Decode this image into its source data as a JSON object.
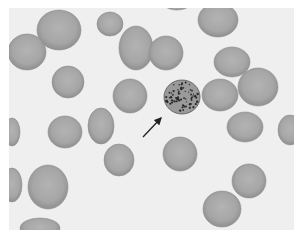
{
  "image": {
    "subject": "Blood smear micrograph showing red blood cells with one stippled cell indicated by an arrow",
    "colors": {
      "background": "#efefef",
      "rbc_fill": "#a9a9a9",
      "rbc_edge": "#8e8e8e",
      "stippled_cell": "#9a9a9a",
      "stipple_dots": "#2a2a2a",
      "arrow": "#222222"
    },
    "cells": [
      {
        "cx": 59,
        "cy": 30,
        "rx": 22,
        "ry": 20
      },
      {
        "cx": 27,
        "cy": 52,
        "rx": 19,
        "ry": 18
      },
      {
        "cx": 110,
        "cy": 24,
        "rx": 13,
        "ry": 12
      },
      {
        "cx": 136,
        "cy": 48,
        "rx": 17,
        "ry": 22
      },
      {
        "cx": 166,
        "cy": 53,
        "rx": 17,
        "ry": 17
      },
      {
        "cx": 218,
        "cy": 20,
        "rx": 20,
        "ry": 17
      },
      {
        "cx": 232,
        "cy": 62,
        "rx": 18,
        "ry": 15
      },
      {
        "cx": 258,
        "cy": 87,
        "rx": 20,
        "ry": 19
      },
      {
        "cx": 220,
        "cy": 95,
        "rx": 18,
        "ry": 16
      },
      {
        "cx": 68,
        "cy": 82,
        "rx": 16,
        "ry": 16
      },
      {
        "cx": 130,
        "cy": 96,
        "rx": 17,
        "ry": 17
      },
      {
        "cx": 65,
        "cy": 132,
        "rx": 17,
        "ry": 16
      },
      {
        "cx": 101,
        "cy": 126,
        "rx": 13,
        "ry": 18
      },
      {
        "cx": 119,
        "cy": 160,
        "rx": 15,
        "ry": 16
      },
      {
        "cx": 180,
        "cy": 154,
        "rx": 17,
        "ry": 17
      },
      {
        "cx": 245,
        "cy": 127,
        "rx": 18,
        "ry": 15
      },
      {
        "cx": 249,
        "cy": 181,
        "rx": 17,
        "ry": 17
      },
      {
        "cx": 222,
        "cy": 209,
        "rx": 19,
        "ry": 18
      },
      {
        "cx": 48,
        "cy": 187,
        "rx": 20,
        "ry": 22
      },
      {
        "cx": 12,
        "cy": 132,
        "rx": 8,
        "ry": 14
      },
      {
        "cx": 12,
        "cy": 185,
        "rx": 10,
        "ry": 17
      },
      {
        "cx": 40,
        "cy": 228,
        "rx": 20,
        "ry": 10
      },
      {
        "cx": 290,
        "cy": 130,
        "rx": 12,
        "ry": 15
      },
      {
        "cx": 177,
        "cy": 5,
        "rx": 12,
        "ry": 5
      }
    ],
    "stippled_cell": {
      "cx": 182,
      "cy": 97,
      "rx": 18,
      "ry": 17
    },
    "arrow": {
      "x1": 143,
      "y1": 137,
      "x2": 161,
      "y2": 118
    }
  }
}
